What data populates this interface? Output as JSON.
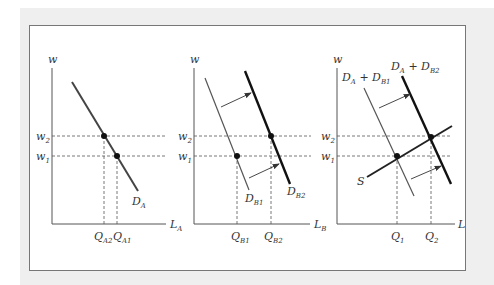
{
  "figure": {
    "panels": [
      {
        "id": "market-A",
        "y_axis_label": "w",
        "x_axis_label": "L",
        "x_axis_sub": "A",
        "wage_labels": [
          {
            "main": "w",
            "sub": "2"
          },
          {
            "main": "w",
            "sub": "1"
          }
        ],
        "curves": [
          {
            "name": "D",
            "sub": "A",
            "style": "medium"
          }
        ],
        "quantity_labels": [
          {
            "main": "Q",
            "sub": "A2"
          },
          {
            "main": "Q",
            "sub": "A1"
          }
        ]
      },
      {
        "id": "market-B",
        "y_axis_label": "w",
        "x_axis_label": "L",
        "x_axis_sub": "B",
        "wage_labels": [
          {
            "main": "w",
            "sub": "2"
          },
          {
            "main": "w",
            "sub": "1"
          }
        ],
        "curves": [
          {
            "name": "D",
            "sub": "B1",
            "style": "thin"
          },
          {
            "name": "D",
            "sub": "B2",
            "style": "thick"
          }
        ],
        "quantity_labels": [
          {
            "main": "Q",
            "sub": "B1"
          },
          {
            "main": "Q",
            "sub": "B2"
          }
        ],
        "shift_arrows": 2
      },
      {
        "id": "total-market",
        "y_axis_label": "w",
        "x_axis_label": "L",
        "wage_labels": [
          {
            "main": "w",
            "sub": "2"
          },
          {
            "main": "w",
            "sub": "1"
          }
        ],
        "curves": [
          {
            "name": "D_A + D_B1",
            "parts": [
              "D",
              "A",
              " + D",
              "B1"
            ],
            "style": "thin"
          },
          {
            "name": "D_A + D_B2",
            "parts": [
              "D",
              "A",
              " + D",
              "B2"
            ],
            "style": "thick"
          },
          {
            "name": "S",
            "style": "medium"
          }
        ],
        "quantity_labels": [
          {
            "main": "Q",
            "sub": "1"
          },
          {
            "main": "Q",
            "sub": "2"
          }
        ],
        "shift_arrows": 2
      }
    ],
    "colors": {
      "line": "#333333",
      "background_band": "#efefef",
      "frame_border": "#777777"
    }
  }
}
